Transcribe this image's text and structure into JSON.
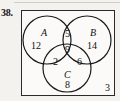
{
  "problem": {
    "number": "38."
  },
  "diagram": {
    "kind": "three-set-venn-diagram",
    "sets": [
      {
        "id": "A",
        "label": "A"
      },
      {
        "id": "B",
        "label": "B"
      },
      {
        "id": "C",
        "label": "C"
      }
    ],
    "regions": [
      {
        "id": "A-only",
        "label": "A only",
        "value": "12"
      },
      {
        "id": "B-only",
        "label": "B only",
        "value": "14"
      },
      {
        "id": "C-only",
        "label": "C only",
        "value": "8"
      },
      {
        "id": "A-and-B",
        "label": "A and B only",
        "value": "5"
      },
      {
        "id": "A-and-C",
        "label": "A and C only",
        "value": "2"
      },
      {
        "id": "B-and-C",
        "label": "B and C only",
        "value": "6"
      },
      {
        "id": "A-and-B-and-C",
        "label": "A and B and C",
        "value": "9"
      },
      {
        "id": "outside",
        "label": "outside all sets",
        "value": "3"
      }
    ],
    "colors": {
      "stroke": "#1a1a1a",
      "text": "#111111",
      "page_background": "#f3f2ef",
      "box_background": "#fbfaf8"
    }
  }
}
